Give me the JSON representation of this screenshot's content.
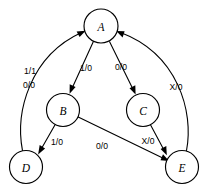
{
  "diagram": {
    "type": "state-transition-diagram",
    "background_color": "#ffffff",
    "line_color": "#000000",
    "node_fill_color": "#ffffff",
    "nodes": [
      {
        "id": "A",
        "label": "A",
        "cx": 101,
        "cy": 26,
        "r": 17
      },
      {
        "id": "B",
        "label": "B",
        "cx": 63,
        "cy": 110,
        "r": 16.5
      },
      {
        "id": "C",
        "label": "C",
        "cx": 143,
        "cy": 110,
        "r": 16.5
      },
      {
        "id": "D",
        "label": "D",
        "cx": 26,
        "cy": 167,
        "r": 16.5
      },
      {
        "id": "E",
        "label": "E",
        "cx": 182,
        "cy": 167,
        "r": 16.5
      }
    ],
    "edges": [
      {
        "id": "D-A",
        "from": "D",
        "to": "A",
        "label": "1/1",
        "label2": "0/0",
        "label_x": 30,
        "label_y": 71,
        "label2_x": 29,
        "label2_y": 85
      },
      {
        "id": "A-B",
        "from": "A",
        "to": "B",
        "label": "1/0",
        "label_x": 86,
        "label_y": 68
      },
      {
        "id": "A-C",
        "from": "A",
        "to": "C",
        "label": "0/0",
        "label_x": 121,
        "label_y": 67
      },
      {
        "id": "E-A",
        "from": "E",
        "to": "A",
        "label": "X/0",
        "label_x": 176,
        "label_y": 87
      },
      {
        "id": "B-D",
        "from": "B",
        "to": "D",
        "label": "1/0",
        "label_x": 57,
        "label_y": 142
      },
      {
        "id": "B-E",
        "from": "B",
        "to": "E",
        "label": "0/0",
        "label_x": 102,
        "label_y": 146
      },
      {
        "id": "C-E",
        "from": "C",
        "to": "E",
        "label": "X/0",
        "label_x": 148,
        "label_y": 141
      }
    ]
  }
}
